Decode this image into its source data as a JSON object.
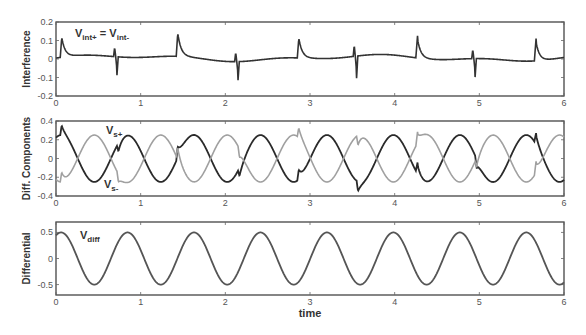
{
  "chart_data": [
    {
      "type": "line",
      "title": "",
      "ylabel": "Interference",
      "xlabel": "",
      "xlim": [
        0,
        6
      ],
      "ylim": [
        -0.2,
        0.2
      ],
      "xticks": [
        "0",
        "1",
        "2",
        "3",
        "4",
        "5",
        "6"
      ],
      "yticks": [
        "-0.2",
        "-0.1",
        "0",
        "0.1",
        "0.2"
      ],
      "annotation": {
        "text": "V",
        "sub1": "int+",
        "mid": " = V",
        "sub2": "int-"
      },
      "series": [
        {
          "name": "V_int",
          "color": "#333333",
          "spikes": [
            {
              "t": 0.05,
              "amp": 0.12,
              "dir": "up"
            },
            {
              "t": 0.72,
              "amp": -0.1,
              "dir": "down"
            },
            {
              "t": 1.42,
              "amp": 0.14,
              "dir": "up"
            },
            {
              "t": 2.15,
              "amp": -0.1,
              "dir": "down"
            },
            {
              "t": 2.85,
              "amp": 0.12,
              "dir": "up"
            },
            {
              "t": 3.55,
              "amp": -0.12,
              "dir": "down"
            },
            {
              "t": 4.25,
              "amp": 0.12,
              "dir": "up"
            },
            {
              "t": 4.95,
              "amp": -0.1,
              "dir": "down"
            },
            {
              "t": 5.65,
              "amp": 0.12,
              "dir": "up"
            }
          ]
        }
      ]
    },
    {
      "type": "line",
      "title": "",
      "ylabel": "Diff. Components",
      "xlabel": "",
      "xlim": [
        0,
        6
      ],
      "ylim": [
        -0.4,
        0.4
      ],
      "xticks": [
        "0",
        "1",
        "2",
        "3",
        "4",
        "5",
        "6"
      ],
      "yticks": [
        "-0.4",
        "-0.2",
        "0",
        "0.2",
        "0.4"
      ],
      "annotations": [
        {
          "text": "V",
          "sub": "s+"
        },
        {
          "text": "V",
          "sub": "s-"
        }
      ],
      "series": [
        {
          "name": "V_s+",
          "color": "#2a2a2a",
          "amplitude": 0.25,
          "period": 0.785,
          "phase": 0
        },
        {
          "name": "V_s-",
          "color": "#a0a0a0",
          "amplitude": 0.25,
          "period": 0.785,
          "phase": 3.14159
        }
      ]
    },
    {
      "type": "line",
      "title": "",
      "ylabel": "Differential",
      "xlabel": "time",
      "xlim": [
        0,
        6
      ],
      "ylim": [
        -0.7,
        0.7
      ],
      "xticks": [
        "0",
        "1",
        "2",
        "3",
        "4",
        "5",
        "6"
      ],
      "yticks": [
        "-0.5",
        "0",
        "0.5"
      ],
      "annotation": {
        "text": "V",
        "sub": "diff"
      },
      "series": [
        {
          "name": "V_diff",
          "color": "#555555",
          "amplitude": 0.5,
          "period": 0.785
        }
      ]
    }
  ]
}
